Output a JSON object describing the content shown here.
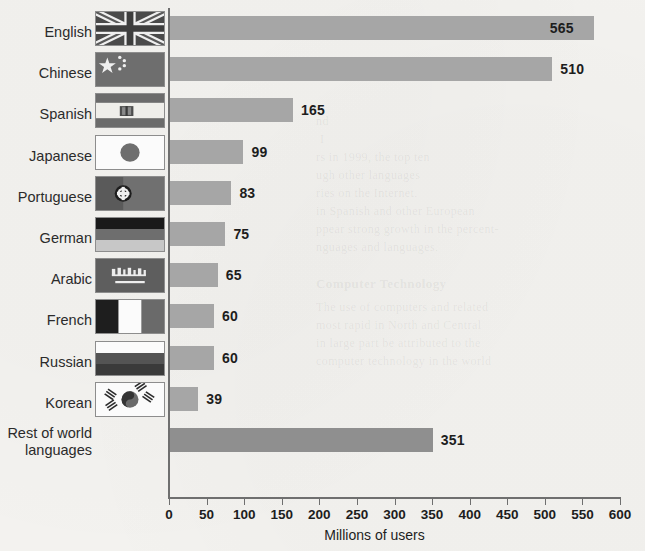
{
  "chart_data": {
    "type": "bar",
    "orientation": "horizontal",
    "title": "",
    "xlabel": "Millions of users",
    "ylabel": "",
    "xlim": [
      0,
      600
    ],
    "xticks": [
      0,
      50,
      100,
      150,
      200,
      250,
      300,
      350,
      400,
      450,
      500,
      550,
      600
    ],
    "grid": false,
    "legend": false,
    "categories": [
      "English",
      "Chinese",
      "Spanish",
      "Japanese",
      "Portuguese",
      "German",
      "Arabic",
      "French",
      "Russian",
      "Korean",
      "Rest of world languages"
    ],
    "values": [
      565,
      510,
      165,
      99,
      83,
      75,
      65,
      60,
      60,
      39,
      351
    ],
    "value_labels": [
      "565",
      "510",
      "165",
      "99",
      "83",
      "75",
      "65",
      "60",
      "60",
      "39",
      "351"
    ]
  },
  "axis": {
    "x_title": "Millions of users",
    "tick_labels": [
      "0",
      "50",
      "100",
      "150",
      "200",
      "250",
      "300",
      "350",
      "400",
      "450",
      "500",
      "550",
      "600"
    ]
  },
  "rows": [
    {
      "label": "English",
      "value_label": "565",
      "value": 565,
      "flag": "flag-uk",
      "flag_name": "united-kingdom-flag",
      "label_inside": true
    },
    {
      "label": "Chinese",
      "value_label": "510",
      "value": 510,
      "flag": "flag-cn",
      "flag_name": "china-flag",
      "label_inside": false
    },
    {
      "label": "Spanish",
      "value_label": "165",
      "value": 165,
      "flag": "flag-es",
      "flag_name": "spain-flag",
      "label_inside": false
    },
    {
      "label": "Japanese",
      "value_label": "99",
      "value": 99,
      "flag": "flag-jp",
      "flag_name": "japan-flag",
      "label_inside": false
    },
    {
      "label": "Portuguese",
      "value_label": "83",
      "value": 83,
      "flag": "flag-pt",
      "flag_name": "portugal-flag",
      "label_inside": false
    },
    {
      "label": "German",
      "value_label": "75",
      "value": 75,
      "flag": "flag-de",
      "flag_name": "germany-flag",
      "label_inside": false
    },
    {
      "label": "Arabic",
      "value_label": "65",
      "value": 65,
      "flag": "flag-sa",
      "flag_name": "saudi-arabia-flag",
      "label_inside": false
    },
    {
      "label": "French",
      "value_label": "60",
      "value": 60,
      "flag": "flag-fr",
      "flag_name": "france-flag",
      "label_inside": false
    },
    {
      "label": "Russian",
      "value_label": "60",
      "value": 60,
      "flag": "flag-ru",
      "flag_name": "russia-flag",
      "label_inside": false
    },
    {
      "label": "Korean",
      "value_label": "39",
      "value": 39,
      "flag": "flag-kr",
      "flag_name": "south-korea-flag",
      "label_inside": false
    },
    {
      "label": "Rest of world languages",
      "value_label": "351",
      "value": 351,
      "flag": "none",
      "flag_name": "no-flag",
      "label_inside": false
    }
  ],
  "colors": {
    "bar": "#a6a6a6",
    "bar_other": "#8f8f8f",
    "axis": "#6f6f6f",
    "text": "#1d1d1d",
    "page_background": "#f3f2ef"
  },
  "background_text": {
    "line1": "nd",
    "line2": "I",
    "line3": "rs in 1999, the top ten",
    "line4": "ugh other languages",
    "line5": "ries on the Internet.",
    "line6": "in Spanish and other European",
    "line7": "ppear strong growth in the percent-",
    "line8": "nguages and languages.",
    "line9": "Computer Technology",
    "line10": "The use of computers and related",
    "line11": "most rapid in North and Central",
    "line12": "in large part be attributed to the",
    "line13": "computer technology in the world"
  }
}
